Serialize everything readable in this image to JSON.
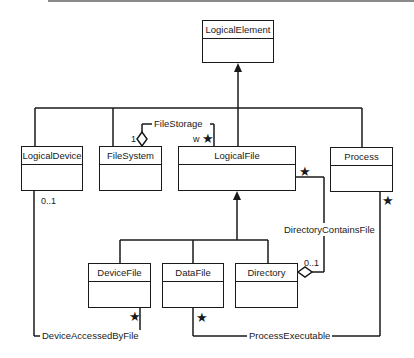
{
  "classes": {
    "logical_element": "LogicalElement",
    "logical_device": "LogicalDevice",
    "file_system": "FileSystem",
    "logical_file": "LogicalFile",
    "process": "Process",
    "device_file": "DeviceFile",
    "data_file": "DataFile",
    "directory": "Directory"
  },
  "associations": {
    "file_storage": "FileStorage",
    "directory_contains_file": "DirectoryContainsFile",
    "device_accessed_by_file": "DeviceAccessedByFile",
    "process_executable": "ProcessExecutable"
  },
  "multiplicities": {
    "file_storage_system": "1",
    "file_storage_file": "w",
    "file_storage_file_star": "★",
    "logical_file_dir_star": "★",
    "directory_zero_one": "0..1",
    "logical_device_zero_one": "0..1",
    "process_star": "★",
    "device_file_star": "★",
    "data_file_star": "★"
  }
}
